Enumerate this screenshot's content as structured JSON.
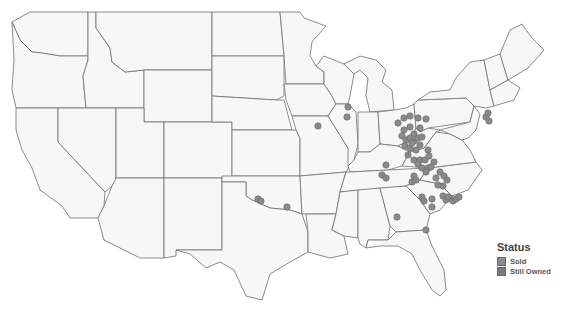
{
  "map": {
    "title": "",
    "region": "Contiguous United States",
    "legend": {
      "title": "Status",
      "items": [
        {
          "label": "Sold",
          "color": "#8c8c8c"
        },
        {
          "label": "Still Owned",
          "color": "#7a7a7a"
        }
      ]
    },
    "points": [
      [
        398,
        123
      ],
      [
        404,
        118
      ],
      [
        410,
        116
      ],
      [
        418,
        118
      ],
      [
        426,
        119
      ],
      [
        404,
        130
      ],
      [
        410,
        127
      ],
      [
        414,
        134
      ],
      [
        420,
        128
      ],
      [
        402,
        136
      ],
      [
        406,
        140
      ],
      [
        410,
        138
      ],
      [
        414,
        141
      ],
      [
        418,
        138
      ],
      [
        422,
        137
      ],
      [
        405,
        146
      ],
      [
        410,
        148
      ],
      [
        416,
        150
      ],
      [
        412,
        143
      ],
      [
        420,
        145
      ],
      [
        408,
        155
      ],
      [
        414,
        160
      ],
      [
        420,
        160
      ],
      [
        428,
        150
      ],
      [
        429,
        156
      ],
      [
        425,
        160
      ],
      [
        418,
        164
      ],
      [
        422,
        168
      ],
      [
        428,
        168
      ],
      [
        431,
        167
      ],
      [
        434,
        162
      ],
      [
        426,
        172
      ],
      [
        414,
        176
      ],
      [
        412,
        182
      ],
      [
        416,
        180
      ],
      [
        386,
        165
      ],
      [
        382,
        175
      ],
      [
        386,
        178
      ],
      [
        436,
        178
      ],
      [
        440,
        172
      ],
      [
        444,
        176
      ],
      [
        447,
        180
      ],
      [
        443,
        186
      ],
      [
        438,
        185
      ],
      [
        486,
        117
      ],
      [
        489,
        121
      ],
      [
        488,
        113
      ],
      [
        422,
        197
      ],
      [
        424,
        201
      ],
      [
        432,
        199
      ],
      [
        432,
        207
      ],
      [
        443,
        196
      ],
      [
        446,
        200
      ],
      [
        450,
        198
      ],
      [
        453,
        201
      ],
      [
        456,
        199
      ],
      [
        459,
        197
      ],
      [
        448,
        197
      ],
      [
        397,
        217
      ],
      [
        426,
        230
      ],
      [
        348,
        107
      ],
      [
        347,
        117
      ],
      [
        318,
        126
      ],
      [
        258,
        199
      ],
      [
        261,
        201
      ],
      [
        287,
        207
      ]
    ]
  }
}
